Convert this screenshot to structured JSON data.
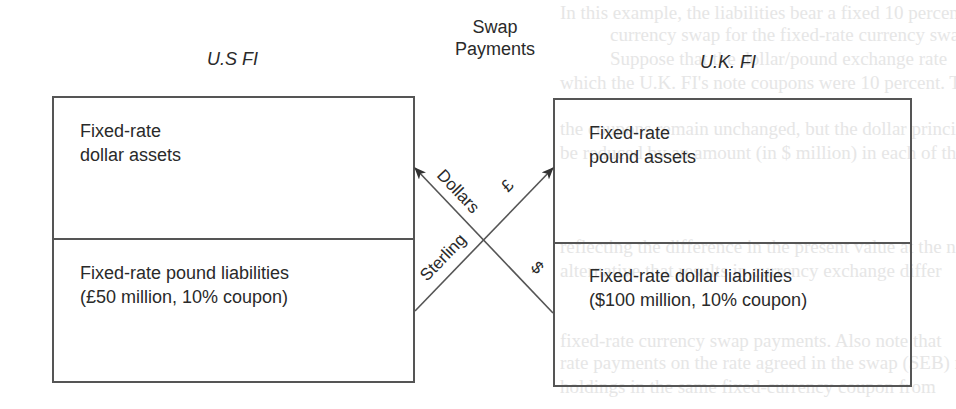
{
  "diagram": {
    "center_title": {
      "line1": "Swap",
      "line2": "Payments"
    },
    "left_party": {
      "title": "U.S FI",
      "top_cell": {
        "line1": "Fixed-rate",
        "line2": "dollar assets"
      },
      "bottom_cell": {
        "line1": "Fixed-rate pound liabilities",
        "line2": "(£50 million, 10% coupon)"
      }
    },
    "right_party": {
      "title": "U.K. FI",
      "top_cell": {
        "line1": "Fixed-rate",
        "line2": "pound assets"
      },
      "bottom_cell": {
        "line1": "Fixed-rate dollar liabilities",
        "line2": "($100 million, 10% coupon)"
      }
    },
    "flows": [
      {
        "label": "Dollars",
        "symbol": "$",
        "direction": "U.K. FI → U.S FI"
      },
      {
        "label": "Sterling",
        "symbol": "£",
        "direction": "U.S FI → U.K. FI"
      }
    ],
    "colors": {
      "line": "#555555",
      "text": "#2a2a2a",
      "background": "#ffffff"
    }
  }
}
